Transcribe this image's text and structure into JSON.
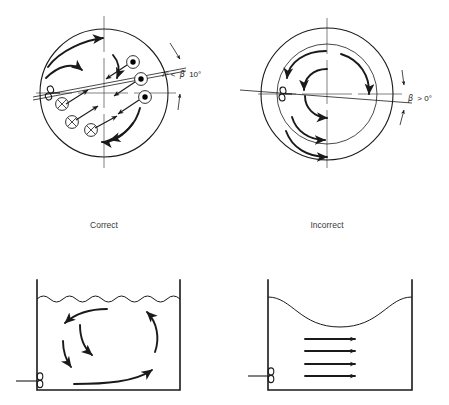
{
  "figure": {
    "background_color": "#ffffff",
    "ink_color": "#1a1a1a"
  },
  "panels": [
    {
      "id": "top-left",
      "caption": "Correct",
      "view": "circular tank cross-section, plan view",
      "annotation": {
        "text": "7° < β 10°",
        "lead": "7° <",
        "symbol": "β",
        "trail": "10°"
      },
      "flow_markers": {
        "out_of_page_count": 3,
        "into_page_count": 3,
        "out_of_page_symbol": "filled-dot",
        "into_page_symbol": "cross-circle"
      },
      "arc_count": 3,
      "impeller": "side-entering propeller"
    },
    {
      "id": "top-right",
      "caption": "Incorrect",
      "view": "circular tank cross-section, plan view",
      "annotation": {
        "text": "β > 0°",
        "lead": "",
        "symbol": "β",
        "trail": "> 0°"
      },
      "arc_count": 5,
      "impeller": "side-entering propeller",
      "note": "concentric swirl, no axial mixing"
    },
    {
      "id": "bottom-left",
      "view": "tank elevation, side view",
      "surface": "rippled",
      "surface_wave_count": 11,
      "flow": "circulating loop",
      "impeller": "side-entering propeller"
    },
    {
      "id": "bottom-right",
      "view": "tank elevation, side view",
      "surface": "vortex depression",
      "flow": "straight horizontal streamlines",
      "streamline_count": 4,
      "impeller": "side-entering propeller"
    }
  ]
}
